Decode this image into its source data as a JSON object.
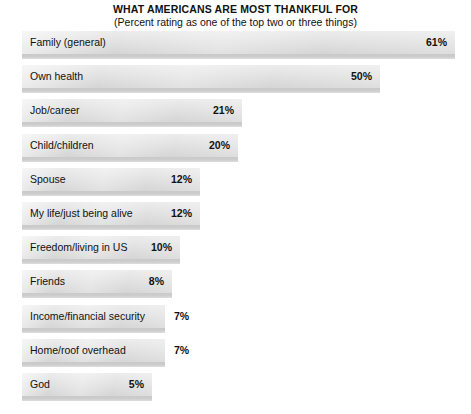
{
  "chart": {
    "title": "WHAT AMERICANS ARE MOST THANKFUL FOR",
    "subtitle": "(Percent rating as one of the top two or three things)"
  },
  "chart_data": {
    "type": "bar",
    "orientation": "horizontal",
    "title": "WHAT AMERICANS ARE MOST THANKFUL FOR",
    "subtitle": "(Percent rating as one of the top two or three things)",
    "xlabel": "",
    "ylabel": "",
    "xlim": [
      0,
      61
    ],
    "grid": false,
    "legend": false,
    "value_suffix": "%",
    "categories": [
      "Family (general)",
      "Own health",
      "Job/career",
      "Child/children",
      "Spouse",
      "My life/just being alive",
      "Freedom/living in US",
      "Friends",
      "Income/financial security",
      "Home/roof overhead",
      "God"
    ],
    "values": [
      61,
      50,
      21,
      20,
      12,
      12,
      10,
      8,
      7,
      7,
      5
    ],
    "data_labels": [
      "61%",
      "50%",
      "21%",
      "20%",
      "12%",
      "12%",
      "10%",
      "8%",
      "7%",
      "7%",
      "5%"
    ],
    "bar_color": "#e3e3e3",
    "bar_shadow_color": "#c9c9c9",
    "text_color": "#111111",
    "background_color": "#ffffff"
  },
  "bars": [
    {
      "label": "Family (general)",
      "value_label": "61%",
      "pixel_width": 433,
      "label_placement": "inside"
    },
    {
      "label": "Own health",
      "value_label": "50%",
      "pixel_width": 358,
      "label_placement": "inside"
    },
    {
      "label": "Job/career",
      "value_label": "21%",
      "pixel_width": 220,
      "label_placement": "inside"
    },
    {
      "label": "Child/children",
      "value_label": "20%",
      "pixel_width": 216,
      "label_placement": "inside"
    },
    {
      "label": "Spouse",
      "value_label": "12%",
      "pixel_width": 178,
      "label_placement": "inside"
    },
    {
      "label": "My life/just being alive",
      "value_label": "12%",
      "pixel_width": 178,
      "label_placement": "inside"
    },
    {
      "label": "Freedom/living in US",
      "value_label": "10%",
      "pixel_width": 158,
      "label_placement": "inside"
    },
    {
      "label": "Friends",
      "value_label": "8%",
      "pixel_width": 150,
      "label_placement": "inside"
    },
    {
      "label": "Income/financial security",
      "value_label": "7%",
      "pixel_width": 143,
      "label_placement": "outside"
    },
    {
      "label": "Home/roof overhead",
      "value_label": "7%",
      "pixel_width": 143,
      "label_placement": "outside"
    },
    {
      "label": "God",
      "value_label": "5%",
      "pixel_width": 130,
      "label_placement": "inside"
    }
  ]
}
